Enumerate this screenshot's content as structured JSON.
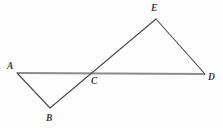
{
  "figure": {
    "background_color": "#fefefe",
    "width": 223,
    "height": 128,
    "line_colors": {
      "baseline": "#8c8c8c",
      "segment": "#4a4a4a",
      "label": "#3a3a3a"
    },
    "points": [
      {
        "id": "A",
        "label": "A",
        "x": 17,
        "y": 73,
        "label_x": 7,
        "label_y": 61
      },
      {
        "id": "B",
        "label": "B",
        "x": 50,
        "y": 108,
        "label_x": 46,
        "label_y": 113
      },
      {
        "id": "C",
        "label": "C",
        "x": 94,
        "y": 73,
        "label_x": 91,
        "label_y": 76
      },
      {
        "id": "D",
        "label": "D",
        "x": 205,
        "y": 74,
        "label_x": 208,
        "label_y": 72
      },
      {
        "id": "E",
        "label": "E",
        "x": 156,
        "y": 19,
        "label_x": 151,
        "label_y": 3
      }
    ],
    "segments": [
      {
        "id": "AD",
        "from": "A",
        "to": "D",
        "role": "baseline",
        "stroke_width": 2.1,
        "color": "#8c8c8c"
      },
      {
        "id": "AB",
        "from": "A",
        "to": "B",
        "role": "triangle-side",
        "stroke_width": 1.1,
        "color": "#4a4a4a"
      },
      {
        "id": "BE",
        "from": "B",
        "to": "E",
        "role": "transversal",
        "stroke_width": 1.1,
        "color": "#4a4a4a"
      },
      {
        "id": "ED",
        "from": "E",
        "to": "D",
        "role": "triangle-side",
        "stroke_width": 1.1,
        "color": "#4a4a4a"
      }
    ],
    "triangles": [
      {
        "id": "ABC",
        "vertices": [
          "A",
          "B",
          "C"
        ],
        "position": "lower-left"
      },
      {
        "id": "CDE",
        "vertices": [
          "C",
          "D",
          "E"
        ],
        "position": "upper-right"
      }
    ]
  },
  "chart_data": {
    "type": "scatter",
    "xlabel": "",
    "ylabel": "",
    "xlim": [
      0,
      223
    ],
    "ylim": [
      0,
      128
    ],
    "grid": false,
    "legend": "none",
    "categories": [
      "A",
      "B",
      "C",
      "D",
      "E"
    ],
    "x": [
      17,
      50,
      94,
      205,
      156
    ],
    "y": [
      73,
      108,
      73,
      74,
      19
    ],
    "annotations": [
      "A",
      "B",
      "C",
      "D",
      "E"
    ],
    "series": [
      {
        "name": "segment-AD",
        "x": [
          17,
          205
        ],
        "y": [
          73,
          74
        ]
      },
      {
        "name": "segment-AB",
        "x": [
          17,
          50
        ],
        "y": [
          73,
          108
        ]
      },
      {
        "name": "segment-BE",
        "x": [
          50,
          156
        ],
        "y": [
          108,
          19
        ]
      },
      {
        "name": "segment-ED",
        "x": [
          156,
          205
        ],
        "y": [
          19,
          74
        ]
      }
    ]
  }
}
